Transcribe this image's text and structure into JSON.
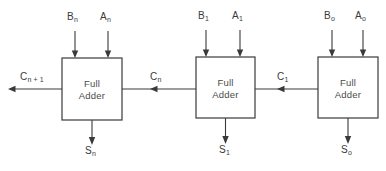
{
  "diagram": {
    "background_color": "#ffffff",
    "line_color": "#3a3a3a",
    "stages": [
      {
        "id": "stage-n",
        "box_label_line1": "Full",
        "box_label_line2": "Adder",
        "input_b": {
          "base": "B",
          "sub": "n"
        },
        "input_a": {
          "base": "A",
          "sub": "n"
        },
        "carry_out": {
          "base": "C",
          "sub": "n + 1"
        },
        "carry_in": {
          "base": "C",
          "sub": "n"
        },
        "sum_out": {
          "base": "S",
          "sub": "n"
        }
      },
      {
        "id": "stage-1",
        "box_label_line1": "Full",
        "box_label_line2": "Adder",
        "input_b": {
          "base": "B",
          "sub": "1"
        },
        "input_a": {
          "base": "A",
          "sub": "1"
        },
        "carry_out": {
          "base": "C",
          "sub": "n"
        },
        "carry_in": {
          "base": "C",
          "sub": "1"
        },
        "sum_out": {
          "base": "S",
          "sub": "1"
        }
      },
      {
        "id": "stage-0",
        "box_label_line1": "Full",
        "box_label_line2": "Adder",
        "input_b": {
          "base": "B",
          "sub": "o"
        },
        "input_a": {
          "base": "A",
          "sub": "o"
        },
        "carry_out": {
          "base": "C",
          "sub": "1"
        },
        "carry_in": null,
        "sum_out": {
          "base": "S",
          "sub": "o"
        }
      }
    ],
    "labels": {
      "b_n": "B",
      "b_n_sub": "n",
      "a_n": "A",
      "a_n_sub": "n",
      "c_n1": "C",
      "c_n1_sub": "n + 1",
      "c_n": "C",
      "c_n_sub": "n",
      "s_n": "S",
      "s_n_sub": "n",
      "b_1": "B",
      "b_1_sub": "1",
      "a_1": "A",
      "a_1_sub": "1",
      "c_1": "C",
      "c_1_sub": "1",
      "s_1": "S",
      "s_1_sub": "1",
      "b_0": "B",
      "b_0_sub": "o",
      "a_0": "A",
      "a_0_sub": "o",
      "s_0": "S",
      "s_0_sub": "o",
      "full": "Full",
      "adder": "Adder"
    }
  }
}
